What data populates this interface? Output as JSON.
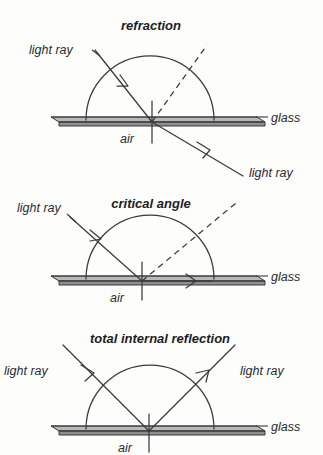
{
  "figure": {
    "background_color": "#fdfdfc",
    "ink_color": "#3a3a3a",
    "hatch_color": "#b9b9b9"
  },
  "panels": [
    {
      "id": "refraction",
      "title": "refraction",
      "incident_label": "light ray",
      "emergent_label": "light ray",
      "glass_label": "glass",
      "air_label": "air",
      "description": "Ray travelling inside the glass semicircle strikes the flat boundary, bends away from the normal and emerges into the air below at a larger angle.",
      "normal_style": "solid vertical line",
      "dashed_line": "continuation of the incident ray (undeviated path)"
    },
    {
      "id": "critical-angle",
      "title": "critical angle",
      "incident_label": "light ray",
      "emergent_label": "light ray",
      "glass_label": "glass",
      "air_label": "air",
      "description": "The angle of incidence equals the critical angle, so the refracted ray grazes along the glass-air boundary at 90 degrees to the normal.",
      "normal_style": "solid vertical line",
      "dashed_line": "continuation of the incident ray (undeviated path)"
    },
    {
      "id": "total-internal-reflection",
      "title": "total internal reflection",
      "incident_label": "light ray",
      "emergent_label": "light ray",
      "glass_label": "glass",
      "air_label": "air",
      "description": "Beyond the critical angle no light escapes; the ray is entirely reflected back into the glass at an equal angle on the other side of the normal.",
      "normal_style": "solid vertical line",
      "dashed_line": "none"
    }
  ]
}
